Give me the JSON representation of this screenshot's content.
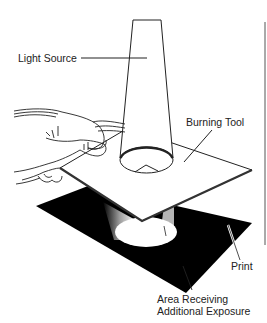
{
  "diagram": {
    "labels": {
      "light_source": "Light Source",
      "burning_tool": "Burning Tool",
      "print": "Print",
      "area_line1": "Area Receiving",
      "area_line2": "Additional Exposure"
    },
    "colors": {
      "ink": "#222222",
      "print_fill": "#000000",
      "board_fill": "#ffffff",
      "background": "#ffffff"
    }
  }
}
